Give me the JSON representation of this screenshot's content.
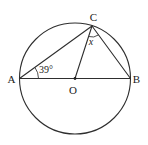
{
  "figure": {
    "points": {
      "a": "A",
      "b": "B",
      "c": "C",
      "o": "O"
    },
    "angle_labels": {
      "at_a": "39°",
      "at_c": "x"
    }
  },
  "colors": {
    "line": "#2e2e2e",
    "text": "#1a1a1a",
    "background": "#ffffff"
  }
}
